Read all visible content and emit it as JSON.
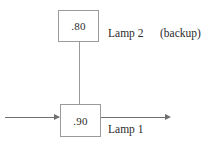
{
  "diagram": {
    "type": "reliability-block-diagram",
    "colors": {
      "background": "#ffffff",
      "box_border": "#9b9b9b",
      "wire": "#6f6f6f",
      "text": "#2b2b2b"
    },
    "blocks": [
      {
        "id": "lamp2",
        "value": ".80",
        "label": "Lamp 2",
        "annotation": "(backup)",
        "position": "top"
      },
      {
        "id": "lamp1",
        "value": ".90",
        "label": "Lamp 1",
        "annotation": "",
        "position": "bottom"
      }
    ],
    "connectors": {
      "vertical_label": "parallel-link",
      "input_label": "input-arrow",
      "output_label": "output-arrow"
    }
  }
}
